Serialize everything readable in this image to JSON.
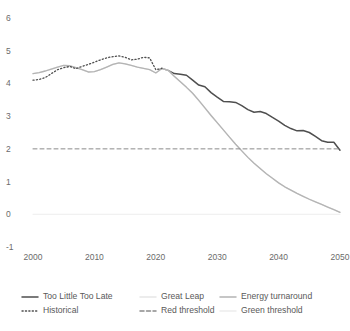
{
  "chart_data": {
    "type": "line",
    "title": "",
    "xlabel": "",
    "ylabel": "",
    "xlim": [
      2000,
      2050
    ],
    "ylim": [
      -1,
      6
    ],
    "grid": false,
    "legend_position": "bottom",
    "x_ticks": [
      "2000",
      "2010",
      "2020",
      "2030",
      "2040",
      "2050"
    ],
    "y_ticks": [
      "6",
      "5",
      "4",
      "3",
      "2",
      "1",
      "0",
      "-1"
    ],
    "series": [
      {
        "name": "Too Little Too Late",
        "style": "solid",
        "color": "#4f4f4f",
        "width": 1.5,
        "x": [
          2021,
          2022,
          2023,
          2024,
          2025,
          2026,
          2027,
          2028,
          2029,
          2030,
          2031,
          2032,
          2033,
          2034,
          2035,
          2036,
          2037,
          2038,
          2039,
          2040,
          2041,
          2042,
          2043,
          2044,
          2045,
          2046,
          2047,
          2048,
          2049,
          2050
        ],
        "values": [
          4.46,
          4.4,
          4.3,
          4.28,
          4.25,
          4.1,
          3.95,
          3.9,
          3.72,
          3.58,
          3.45,
          3.44,
          3.42,
          3.32,
          3.2,
          3.12,
          3.14,
          3.08,
          2.96,
          2.85,
          2.72,
          2.62,
          2.55,
          2.56,
          2.5,
          2.38,
          2.25,
          2.2,
          2.2,
          1.96
        ]
      },
      {
        "name": "Great Leap",
        "style": "solid",
        "color": "#e6e6e6",
        "width": 1.4,
        "x": [
          2000,
          2001,
          2002,
          2003,
          2004,
          2005,
          2006,
          2007,
          2008,
          2009,
          2010,
          2011,
          2012,
          2013,
          2014,
          2015,
          2016,
          2017,
          2018,
          2019,
          2020,
          2021,
          2022,
          2023,
          2024,
          2025,
          2026,
          2027,
          2028,
          2029,
          2030,
          2031,
          2032,
          2033,
          2034,
          2035,
          2036,
          2037,
          2038,
          2039,
          2040,
          2041,
          2042,
          2043,
          2044,
          2045,
          2046,
          2047,
          2048,
          2049,
          2050
        ],
        "values": [
          4.3,
          4.33,
          4.38,
          4.44,
          4.5,
          4.55,
          4.54,
          4.48,
          4.42,
          4.35,
          4.36,
          4.42,
          4.5,
          4.58,
          4.63,
          4.6,
          4.55,
          4.5,
          4.46,
          4.42,
          4.32,
          4.46,
          4.4,
          4.22,
          4.05,
          3.88,
          3.7,
          3.48,
          3.25,
          3.02,
          2.8,
          2.58,
          2.36,
          2.14,
          1.94,
          1.74,
          1.56,
          1.4,
          1.24,
          1.1,
          0.96,
          0.84,
          0.74,
          0.64,
          0.55,
          0.46,
          0.38,
          0.3,
          0.22,
          0.14,
          0.06
        ]
      },
      {
        "name": "Energy turnaround",
        "style": "solid",
        "color": "#b4b4b4",
        "width": 1.3,
        "x": [
          2000,
          2001,
          2002,
          2003,
          2004,
          2005,
          2006,
          2007,
          2008,
          2009,
          2010,
          2011,
          2012,
          2013,
          2014,
          2015,
          2016,
          2017,
          2018,
          2019,
          2020,
          2021,
          2022,
          2023,
          2024,
          2025,
          2026,
          2027,
          2028,
          2029,
          2030,
          2031,
          2032,
          2033,
          2034,
          2035,
          2036,
          2037,
          2038,
          2039,
          2040,
          2041,
          2042,
          2043,
          2044,
          2045,
          2046,
          2047,
          2048,
          2049,
          2050
        ],
        "values": [
          4.3,
          4.33,
          4.38,
          4.44,
          4.5,
          4.55,
          4.54,
          4.48,
          4.42,
          4.35,
          4.36,
          4.42,
          4.5,
          4.58,
          4.63,
          4.6,
          4.55,
          4.5,
          4.46,
          4.42,
          4.32,
          4.46,
          4.4,
          4.22,
          4.05,
          3.88,
          3.7,
          3.48,
          3.25,
          3.02,
          2.8,
          2.58,
          2.36,
          2.14,
          1.94,
          1.74,
          1.56,
          1.4,
          1.24,
          1.1,
          0.96,
          0.84,
          0.74,
          0.64,
          0.55,
          0.46,
          0.38,
          0.3,
          0.22,
          0.14,
          0.06
        ]
      },
      {
        "name": "Historical",
        "style": "dotted",
        "color": "#4f4f4f",
        "width": 1.3,
        "x": [
          2000,
          2001,
          2002,
          2003,
          2004,
          2005,
          2006,
          2007,
          2008,
          2009,
          2010,
          2011,
          2012,
          2013,
          2014,
          2015,
          2016,
          2017,
          2018,
          2019,
          2020,
          2021
        ],
        "values": [
          4.1,
          4.12,
          4.18,
          4.3,
          4.42,
          4.48,
          4.52,
          4.45,
          4.52,
          4.58,
          4.65,
          4.72,
          4.78,
          4.82,
          4.84,
          4.8,
          4.72,
          4.74,
          4.8,
          4.78,
          4.42,
          4.46
        ]
      },
      {
        "name": "Red threshold",
        "style": "dashed",
        "color": "#8a8a8a",
        "width": 1.0,
        "x": [
          2000,
          2050
        ],
        "values": [
          2.0,
          2.0
        ]
      },
      {
        "name": "Green threshold",
        "style": "solid",
        "color": "#ededed",
        "width": 1.0,
        "x": [
          2000,
          2050
        ],
        "values": [
          0.0,
          0.0
        ]
      }
    ]
  },
  "legend": {
    "entries": [
      {
        "label": "Too Little Too Late",
        "swatch": "solid",
        "color": "#4f4f4f"
      },
      {
        "label": "Great Leap",
        "swatch": "solid",
        "color": "#e6e6e6"
      },
      {
        "label": "Energy turnaround",
        "swatch": "solid",
        "color": "#b4b4b4"
      },
      {
        "label": "Historical",
        "swatch": "dotted",
        "color": "#4f4f4f"
      },
      {
        "label": "Red threshold",
        "swatch": "dashed",
        "color": "#8a8a8a"
      },
      {
        "label": "Green threshold",
        "swatch": "solid",
        "color": "#ededed"
      }
    ]
  }
}
